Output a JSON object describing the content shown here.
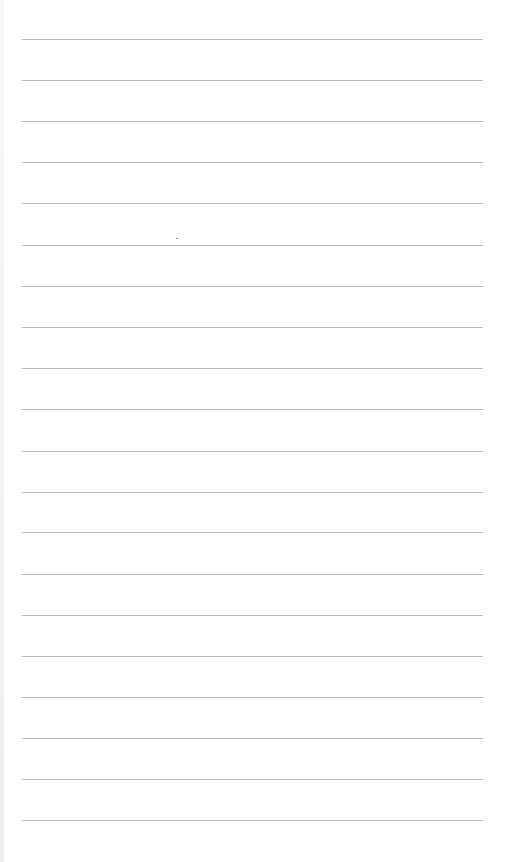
{
  "page": {
    "type": "lined-paper",
    "background": "#ffffff",
    "line_color": "#b8b8b8",
    "line_count": 20,
    "line_left": 22,
    "line_width": 461,
    "first_line_y": 39,
    "line_spacing": 41.1
  },
  "lines": [
    {
      "y": 39
    },
    {
      "y": 80
    },
    {
      "y": 121
    },
    {
      "y": 162
    },
    {
      "y": 203
    },
    {
      "y": 245
    },
    {
      "y": 286
    },
    {
      "y": 327
    },
    {
      "y": 368
    },
    {
      "y": 409
    },
    {
      "y": 451
    },
    {
      "y": 492
    },
    {
      "y": 532
    },
    {
      "y": 574
    },
    {
      "y": 615
    },
    {
      "y": 656
    },
    {
      "y": 697
    },
    {
      "y": 738
    },
    {
      "y": 779
    },
    {
      "y": 820
    }
  ]
}
